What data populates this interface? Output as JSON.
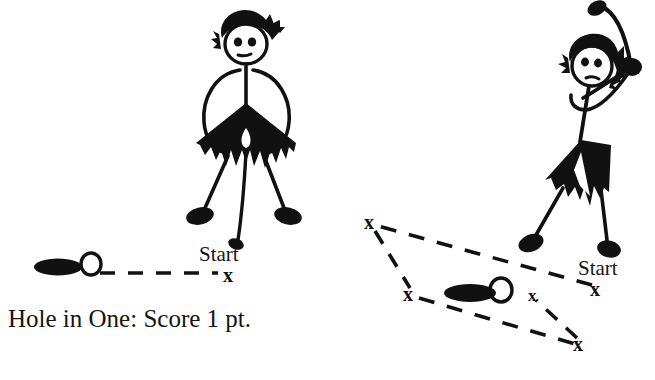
{
  "page": {
    "background_color": "#ffffff",
    "ink_color": "#111111",
    "width": 655,
    "height": 380
  },
  "caption": {
    "text": "Hole in One: Score 1 pt."
  },
  "panels": [
    {
      "id": "left-panel",
      "name": "hole-in-one-panel",
      "golfer": {
        "name": "golfer-standing",
        "pose": "standing-after-putt",
        "hair": "spiky",
        "eyes": 2,
        "club": "putter-down"
      },
      "start_label": "Start",
      "start_mark": "x",
      "ball_mark": "O",
      "hole_mark": "filled-ellipse",
      "shots": 1,
      "stroke_marks": [
        "x"
      ]
    },
    {
      "id": "right-panel",
      "name": "many-strokes-panel",
      "golfer": {
        "name": "golfer-swinging",
        "pose": "mid-backswing",
        "hair": "long-spiky",
        "eyes": 2,
        "mouth": "frown",
        "club": "driver-raised"
      },
      "start_label": "Start",
      "start_mark": "x",
      "ball_mark": "O",
      "hole_mark": "filled-ellipse",
      "shots": 4,
      "stroke_marks": [
        "x",
        "x",
        "x",
        "x",
        "x"
      ]
    }
  ],
  "labels": {
    "start_left": "Start",
    "start_right": "Start",
    "x_left_start": "x",
    "x_right_start": "x",
    "x_upper_left": "x",
    "x_mid_left": "x",
    "x_near_ball": "x",
    "x_bottom_right": "x"
  }
}
